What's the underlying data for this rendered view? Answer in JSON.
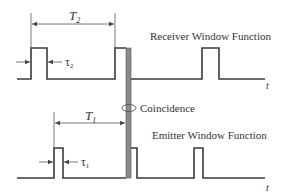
{
  "diagram": {
    "receiver": {
      "title": "Receiver Window Function",
      "period_label": "T",
      "period_sub": "2",
      "width_label": "τ",
      "width_sub": "2",
      "axis_label": "t"
    },
    "emitter": {
      "title": "Emitter Window Function",
      "period_label": "T",
      "period_sub": "1",
      "width_label": "τ",
      "width_sub": "1",
      "axis_label": "t"
    },
    "coincidence_label": "Coincidence",
    "colors": {
      "line": "#3a3a3a",
      "coincidence_bar": "#8a8a8a"
    }
  }
}
